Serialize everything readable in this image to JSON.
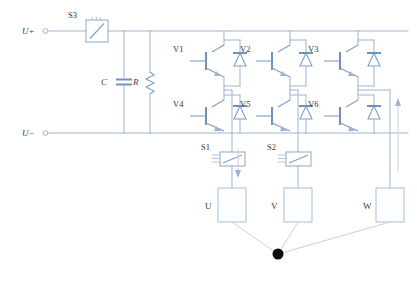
{
  "diagram": {
    "background_color": "#ffffff",
    "wire_color": "#9db4d4",
    "symbol_color": "#7f9ec4",
    "node_color": "#0d0d0d",
    "label_color": "#3d3d42"
  },
  "terminals": {
    "dc_positive": "U+",
    "dc_negative": "U−"
  },
  "dc_link": {
    "capacitor_label": "C",
    "resistor_label": "R"
  },
  "switches": {
    "s3_label": "S3",
    "s1_label": "S1",
    "s2_label": "S2"
  },
  "transistors": {
    "upper": [
      {
        "label": "V1"
      },
      {
        "label": "V2"
      },
      {
        "label": "V3"
      }
    ],
    "lower": [
      {
        "label": "V4"
      },
      {
        "label": "V5"
      },
      {
        "label": "V6"
      }
    ]
  },
  "phases": [
    {
      "label": "U"
    },
    {
      "label": "V"
    },
    {
      "label": "W"
    }
  ],
  "icons": {
    "contactor": "contactor-icon",
    "current-sensor": "current-sensor-icon",
    "capacitor": "capacitor-icon",
    "resistor": "resistor-icon",
    "igbt": "igbt-icon",
    "diode": "freewheel-diode-icon",
    "neutral": "neutral-node-icon",
    "arrow": "current-direction-arrow-icon"
  }
}
